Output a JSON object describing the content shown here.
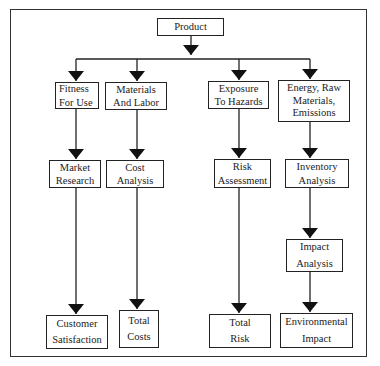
{
  "diagram": {
    "root": {
      "id": "product",
      "label": "Product"
    },
    "columns": [
      {
        "id": "quality",
        "nodes": [
          {
            "id": "fitness-for-use",
            "label": "Fitness\nFor Use"
          },
          {
            "id": "market-research",
            "label": "Market\nResearch"
          },
          {
            "id": "customer-satisfaction",
            "label": "Customer\nSatisfaction"
          }
        ]
      },
      {
        "id": "cost",
        "nodes": [
          {
            "id": "materials-and-labor",
            "label": "Materials\nAnd  Labor"
          },
          {
            "id": "cost-analysis",
            "label": "Cost\nAnalysis"
          },
          {
            "id": "total-costs",
            "label": "Total\nCosts"
          }
        ]
      },
      {
        "id": "risk",
        "nodes": [
          {
            "id": "exposure-to-hazards",
            "label": "Exposure\nTo Hazards"
          },
          {
            "id": "risk-assessment",
            "label": "Risk\nAssessment"
          },
          {
            "id": "total-risk",
            "label": "Total\nRisk"
          }
        ]
      },
      {
        "id": "environment",
        "nodes": [
          {
            "id": "energy-raw-materials-emissions",
            "label": "Energy,  Raw\nMaterials,\nEmissions"
          },
          {
            "id": "inventory-analysis",
            "label": "Inventory\nAnalysis"
          },
          {
            "id": "impact-analysis",
            "label": "Impact\nAnalysis"
          },
          {
            "id": "environmental-impact",
            "label": "Environmental\nImpact"
          }
        ]
      }
    ],
    "edges": [
      [
        "product",
        "fitness-for-use"
      ],
      [
        "product",
        "materials-and-labor"
      ],
      [
        "product",
        "exposure-to-hazards"
      ],
      [
        "product",
        "energy-raw-materials-emissions"
      ],
      [
        "fitness-for-use",
        "market-research"
      ],
      [
        "market-research",
        "customer-satisfaction"
      ],
      [
        "materials-and-labor",
        "cost-analysis"
      ],
      [
        "cost-analysis",
        "total-costs"
      ],
      [
        "exposure-to-hazards",
        "risk-assessment"
      ],
      [
        "risk-assessment",
        "total-risk"
      ],
      [
        "energy-raw-materials-emissions",
        "inventory-analysis"
      ],
      [
        "inventory-analysis",
        "impact-analysis"
      ],
      [
        "impact-analysis",
        "environmental-impact"
      ]
    ],
    "colors": {
      "line": "#222222",
      "background": "#ffffff"
    }
  }
}
